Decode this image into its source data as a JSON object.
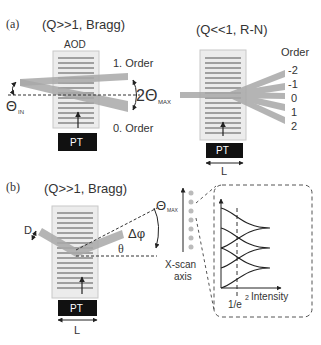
{
  "panel_a": {
    "label": "(a)",
    "left_title": "(Q>>1, Bragg)",
    "right_title": "(Q<<1, R-N)",
    "aod_label": "AOD",
    "first_order": "1. Order",
    "zeroth_order": "0. Order",
    "two_theta_max": "2Θ",
    "two_theta_sub": "MAX",
    "theta_in": "Θ",
    "theta_in_sub": "IN",
    "order_header": "Order",
    "orders": [
      "-2",
      "-1",
      "0",
      "1",
      "2"
    ],
    "pt_label": "PT",
    "length_label": "L"
  },
  "panel_b": {
    "label": "(b)",
    "title": "(Q>>1, Bragg)",
    "d_label": "D",
    "delta_phi": "Δφ",
    "theta": "θ",
    "theta_max": "Θ",
    "theta_max_sub": "MAX",
    "xscan_label_1": "X-scan",
    "xscan_label_2": "axis",
    "intensity_label": "Intensity",
    "e_label": "1/e",
    "e_sup": "2",
    "pt_label": "PT",
    "length_label": "L"
  },
  "colors": {
    "beam": "#a8a8a8",
    "crystal_bg": "#ececec",
    "crystal_border": "#c8c8c8",
    "grating_line": "#555555",
    "pt_fill": "#111111",
    "text": "#333333"
  }
}
